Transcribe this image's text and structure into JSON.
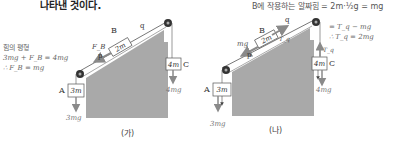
{
  "header": {
    "caption_fragment": "나타낸 것이다.",
    "right_equation": "B에 작용하는 알짜힘 = 2m·½g = mg"
  },
  "colors": {
    "incline_fill": "#a9a9a9",
    "line": "#555555",
    "arrow_gray": "#8a8a8a",
    "text": "#333333"
  },
  "panel_a": {
    "label": "(가)",
    "annotation_title": "힘의 평형",
    "annotation_eq1": "3mg + F_B = 4mg",
    "annotation_eq2": "∴ F_B = mg",
    "block_a": {
      "name": "A",
      "mass": "3m",
      "weight": "3mg"
    },
    "block_b": {
      "name": "B",
      "mass": "2m",
      "force_label": "F_B"
    },
    "block_c": {
      "name": "C",
      "mass": "4m",
      "weight": "4mg"
    },
    "string_p": "p",
    "string_q": "q"
  },
  "panel_b": {
    "label": "(나)",
    "eq1": "= T_q − mg",
    "eq2": "∴ T_q = 2mg",
    "block_a": {
      "name": "A",
      "mass": "3m",
      "weight": "3mg"
    },
    "block_b": {
      "name": "B",
      "mass": "2m",
      "force_down": "mg",
      "force_up": "T_q"
    },
    "block_c": {
      "name": "C",
      "mass": "4m",
      "weight": "4mg",
      "tension": "T_q"
    },
    "string_p": "p",
    "string_q": "q"
  }
}
